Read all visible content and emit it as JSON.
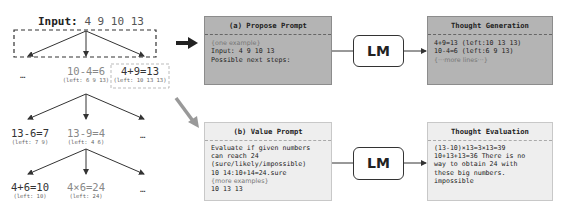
{
  "tree": {
    "input_label": "Input:",
    "input_numbers": "4 9 10 13",
    "level1": [
      {
        "label": "…"
      },
      {
        "eq": "10-4=6",
        "left": "(left: 6 9 13)"
      },
      {
        "eq": "4+9=13",
        "left": "(left: 10 13 13)"
      }
    ],
    "level2": [
      {
        "eq": "13-6=7",
        "left": "(left: 7 9)"
      },
      {
        "eq": "13-9=4",
        "left": "(left: 4 6)"
      },
      {
        "label": "…"
      }
    ],
    "level3": [
      {
        "eq": "4+6=10",
        "left": "(left: 10)"
      },
      {
        "eq": "4×6=24",
        "left": "(left: 24)"
      },
      {
        "label": "…"
      }
    ]
  },
  "propose_prompt": {
    "title": "(a) Propose Prompt",
    "lines": [
      "{one example}",
      "Input: 4 9 10 13",
      "Possible next steps:"
    ]
  },
  "value_prompt": {
    "title": "(b) Value Prompt",
    "lines": [
      "Evaluate if given numbers",
      "can reach 24",
      "(sure/likely/impossible)",
      "10 14:10+14=24.sure",
      "{more examples}",
      "10 13 13"
    ]
  },
  "lm": {
    "top_label": "LM",
    "bottom_label": "LM"
  },
  "thought_generation": {
    "title": "Thought Generation",
    "lines": [
      "4+9=13 (left:10 13 13)",
      "10-4=6 (left:6 9 13)",
      "{···more lines···}"
    ]
  },
  "thought_evaluation": {
    "title": "Thought Evaluation",
    "lines": [
      "(13-10)×13=3×13=39",
      "10+13+13=36 There is no",
      "way to obtain 24 with",
      "these big numbers.",
      "impossible"
    ]
  },
  "colors": {
    "propose_bg": "#b4b4b4",
    "value_bg": "#eeeeee",
    "arrow_dark": "#222222",
    "arrow_grey": "#999999"
  }
}
